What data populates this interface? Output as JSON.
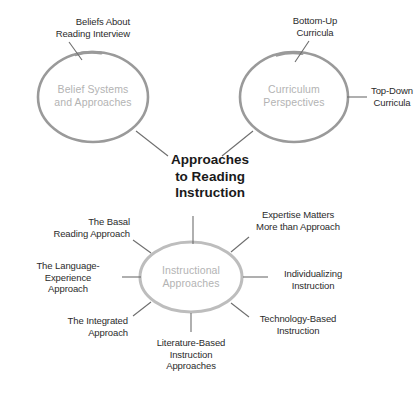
{
  "diagram": {
    "title": "Approaches\nto Reading\nInstruction",
    "colors": {
      "circle_stroke": "#9a9a9a",
      "node_label": "#b3b3b3",
      "leaf_label": "#2b2b2b",
      "connector": "#6e6e6e",
      "background": "#ffffff"
    },
    "nodes": [
      {
        "id": "belief-systems",
        "label": "Belief Systems\nand Approaches",
        "leaves": [
          {
            "id": "beliefs-about-reading-interview",
            "label": "Beliefs About\nReading Interview"
          }
        ]
      },
      {
        "id": "curriculum-perspectives",
        "label": "Curriculum\nPerspectives",
        "leaves": [
          {
            "id": "bottom-up-curricula",
            "label": "Bottom-Up\nCurricula"
          },
          {
            "id": "top-down-curricula",
            "label": "Top-Down\nCurricula"
          }
        ]
      },
      {
        "id": "instructional-approaches",
        "label": "Instructional\nApproaches",
        "leaves": [
          {
            "id": "the-basal-reading-approach",
            "label": "The Basal\nReading Approach"
          },
          {
            "id": "the-language-experience-approach",
            "label": "The Language-\nExperience\nApproach"
          },
          {
            "id": "the-integrated-approach",
            "label": "The Integrated\nApproach"
          },
          {
            "id": "literature-based-instruction-approaches",
            "label": "Literature-Based\nInstruction\nApproaches"
          },
          {
            "id": "technology-based-instruction",
            "label": "Technology-Based\nInstruction"
          },
          {
            "id": "individualizing-instruction",
            "label": "Individualizing\nInstruction"
          },
          {
            "id": "expertise-matters-more-than-approach",
            "label": "Expertise Matters\nMore than Approach"
          }
        ]
      }
    ]
  }
}
